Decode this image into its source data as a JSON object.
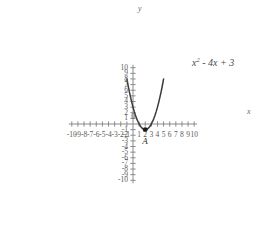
{
  "chart_data": {
    "type": "line",
    "title": "",
    "subtitle": "",
    "xlabel": "x",
    "ylabel": "y",
    "xlim": [
      -10,
      10
    ],
    "ylim": [
      -10,
      10
    ],
    "grid": false,
    "legend_position": "none",
    "equation_label": "x2 - 4x + 3",
    "equation_base": "x",
    "equation_exponent": "2",
    "equation_rest": " - 4x + 3",
    "x_ticks": [
      -10,
      -9,
      -8,
      -7,
      -6,
      -5,
      -4,
      -3,
      -2,
      -1,
      0,
      1,
      2,
      3,
      4,
      5,
      6,
      7,
      8,
      9,
      10
    ],
    "x_tick_labels": [
      "-10",
      "-9",
      "-8",
      "-7",
      "-6",
      "-5",
      "-4",
      "-3",
      "-2",
      "-1",
      "0",
      "1",
      "2",
      "3",
      "4",
      "5",
      "6",
      "7",
      "8",
      "9",
      "10"
    ],
    "y_ticks": [
      -10,
      -9,
      -8,
      -7,
      -6,
      -5,
      -4,
      -3,
      -2,
      -1,
      0,
      1,
      2,
      3,
      4,
      5,
      6,
      7,
      8,
      9,
      10
    ],
    "y_tick_labels": [
      "-10",
      "-9",
      "-8",
      "-7",
      "-6",
      "-5",
      "-4",
      "-3",
      "-2",
      "-1",
      "0",
      "1",
      "2",
      "3",
      "4",
      "5",
      "6",
      "7",
      "8",
      "9",
      "10"
    ],
    "series": [
      {
        "name": "x2 - 4x + 3",
        "color": "#3a3a3a",
        "x": [
          -1.0,
          -0.8,
          -0.6,
          -0.4,
          -0.2,
          0.0,
          0.2,
          0.4,
          0.6,
          0.8,
          1.0,
          1.2,
          1.4,
          1.6,
          1.8,
          2.0,
          2.2,
          2.4,
          2.6,
          2.8,
          3.0,
          3.2,
          3.4,
          3.6,
          3.8,
          4.0,
          4.2,
          4.4,
          4.6,
          4.8,
          5.0
        ],
        "values": [
          8.0,
          6.84,
          5.76,
          4.76,
          3.84,
          3.0,
          2.24,
          1.56,
          0.96,
          0.44,
          0.0,
          -0.36,
          -0.64,
          -0.84,
          -0.96,
          -1.0,
          -0.96,
          -0.84,
          -0.64,
          -0.36,
          0.0,
          0.44,
          0.96,
          1.56,
          2.24,
          3.0,
          3.84,
          4.76,
          5.76,
          6.84,
          8.0
        ]
      }
    ],
    "annotations": [
      {
        "name": "vertex-point",
        "label": "A",
        "x": 2,
        "y": -1,
        "marker": "dot",
        "color": "#1a1a1a"
      }
    ],
    "axis_color": "#8a8a8a",
    "curve_color": "#3a3a3a",
    "background": "#ffffff"
  }
}
